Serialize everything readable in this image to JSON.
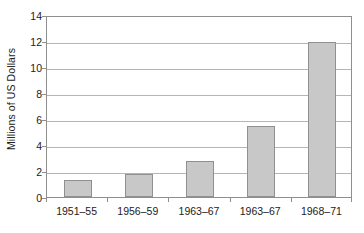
{
  "chart_data": {
    "type": "bar",
    "title": "",
    "subtitle": "",
    "xlabel": "",
    "ylabel": "Millions of US Dollars",
    "categories": [
      "1951–55",
      "1956–59",
      "1963–67",
      "1963–67",
      "1968–71"
    ],
    "values": [
      1.3,
      1.75,
      2.75,
      5.45,
      11.9
    ],
    "ylim": [
      0,
      14
    ],
    "ytick_step": 2,
    "yticks": [
      0,
      2,
      4,
      6,
      8,
      10,
      12,
      14
    ],
    "ytick_labels": [
      "0",
      "2",
      "4",
      "6",
      "8",
      "10",
      "12",
      "14"
    ],
    "grid": true,
    "grid_axis": "y",
    "legend": false,
    "legend_position": "none",
    "bar_fill_color": "#c8c8c8",
    "bar_border_color": "#909090",
    "gridline_color": "#b5b5b5",
    "axis_color": "#8f8f8f",
    "text_color": "#222222",
    "background_color": "#ffffff"
  }
}
